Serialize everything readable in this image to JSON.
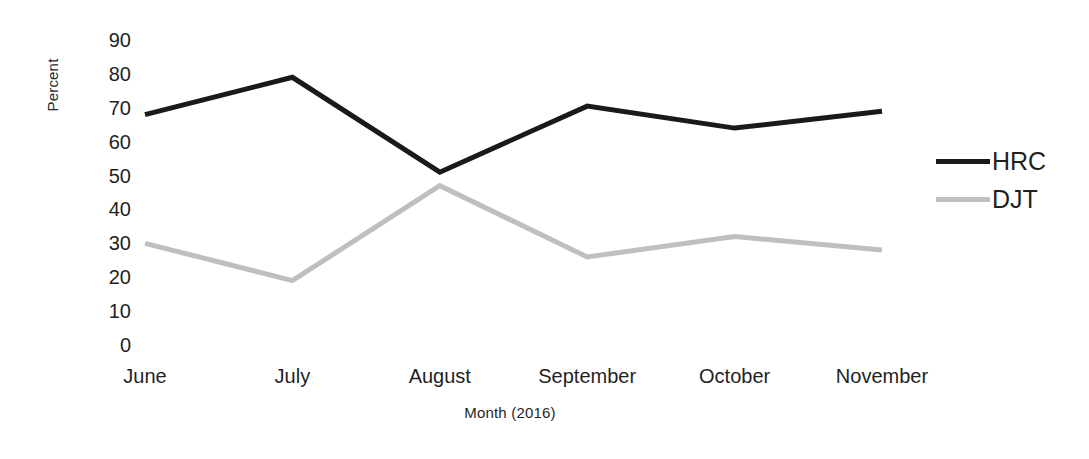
{
  "chart_data": {
    "type": "line",
    "title": "",
    "subtitle": "",
    "xlabel": "Month (2016)",
    "ylabel": "Percent",
    "categories": [
      "June",
      "July",
      "August",
      "September",
      "October",
      "November"
    ],
    "series": [
      {
        "name": "HRC",
        "color": "#1a1a1a",
        "values": [
          68,
          79,
          51,
          70.5,
          64,
          69
        ]
      },
      {
        "name": "DJT",
        "color": "#bfbfbf",
        "values": [
          30,
          19,
          47,
          26,
          32,
          28
        ]
      }
    ],
    "ylim": [
      0,
      90
    ],
    "yticks": [
      "0",
      "10",
      "20",
      "30",
      "40",
      "50",
      "60",
      "70",
      "80",
      "90"
    ],
    "ytick_values": [
      0,
      10,
      20,
      30,
      40,
      50,
      60,
      70,
      80,
      90
    ],
    "grid": false,
    "axis_lines": false,
    "legend_position": "right",
    "legend_entries": [
      "HRC",
      "DJT"
    ],
    "annotations": []
  },
  "colors": {
    "background": "#ffffff",
    "hrc_line": "#1a1a1a",
    "djt_line": "#bfbfbf",
    "text": "#1f1f1f",
    "axis_title": "#262626"
  }
}
